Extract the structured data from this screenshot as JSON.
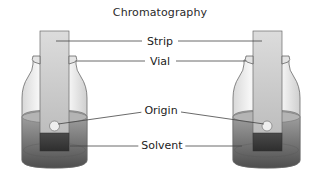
{
  "diagram": {
    "title": "Chromatography",
    "labels": {
      "strip": "Strip",
      "vial": "Vial",
      "origin": "Origin",
      "solvent": "Solvent"
    },
    "vials": [
      {
        "id": "left",
        "components": [
          "strip",
          "vial",
          "origin",
          "solvent"
        ]
      },
      {
        "id": "right",
        "components": [
          "strip",
          "vial",
          "origin",
          "solvent"
        ]
      }
    ],
    "colors": {
      "strip_top": "#d8d8d8",
      "strip_bottom": "#bdbdbd",
      "solvent_light": "#9a9a9a",
      "solvent_dark": "#5a5a5a",
      "strip_wet": "#3a3a3a",
      "outline": "#555555",
      "leader_line": "#444444"
    }
  }
}
